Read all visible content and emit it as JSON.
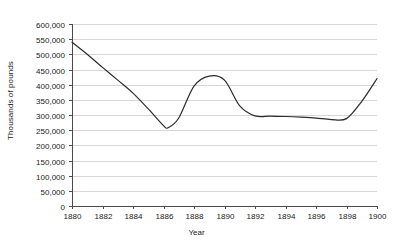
{
  "chart_data": {
    "type": "line",
    "title": "",
    "xlabel": "Year",
    "ylabel": "Thousands of pounds",
    "xlim": [
      1880,
      1900
    ],
    "ylim": [
      0,
      600000
    ],
    "grid": "horizontal",
    "legend": "none",
    "x_ticks": [
      "1880",
      "1882",
      "1884",
      "1886",
      "1888",
      "1890",
      "1892",
      "1894",
      "1896",
      "1898",
      "1900"
    ],
    "y_ticks": [
      "0",
      "50,000",
      "100,000",
      "150,000",
      "200,000",
      "250,000",
      "300,000",
      "350,000",
      "400,000",
      "450,000",
      "500,000",
      "550,000",
      "600,000"
    ],
    "line_color": "#2b2b2b",
    "grid_color": "#d7d7d7",
    "axis_color": "#4a4a4a",
    "series": [
      {
        "name": "Value",
        "x": [
          1880,
          1881,
          1882,
          1883,
          1884,
          1885,
          1886,
          1886.3,
          1887,
          1888,
          1889,
          1890,
          1891,
          1892,
          1893,
          1894,
          1895,
          1896,
          1897,
          1898,
          1899,
          1900
        ],
        "values": [
          540000,
          500000,
          457000,
          415000,
          372000,
          320000,
          265000,
          258000,
          290000,
          395000,
          428000,
          415000,
          330000,
          297000,
          296000,
          295000,
          293000,
          290000,
          285000,
          288000,
          345000,
          420000
        ]
      }
    ]
  },
  "axis_titles": {
    "y": "Thousands of pounds",
    "x": "Year"
  }
}
